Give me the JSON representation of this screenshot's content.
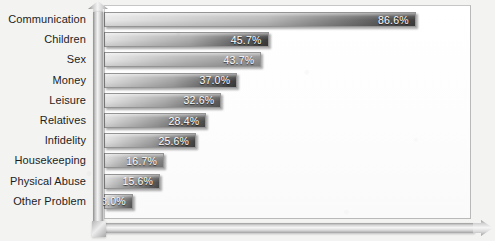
{
  "chart_data": {
    "type": "bar",
    "orientation": "horizontal",
    "title": "",
    "subtitle": "",
    "xlabel": "",
    "ylabel": "",
    "grid": false,
    "legend": null,
    "xlim": [
      0,
      100
    ],
    "value_suffix": "%",
    "categories": [
      "Communication",
      "Children",
      "Sex",
      "Money",
      "Leisure",
      "Relatives",
      "Infidelity",
      "Housekeeping",
      "Physical Abuse",
      "Other Problem"
    ],
    "values": [
      86.6,
      45.7,
      43.7,
      37.0,
      32.6,
      28.4,
      25.6,
      16.7,
      15.6,
      8.0
    ],
    "value_labels": [
      "86.6%",
      "45.7%",
      "43.7%",
      "37.0%",
      "32.6%",
      "28.4%",
      "25.6%",
      "16.7%",
      "15.6%",
      "8.0%"
    ],
    "bar_colors_start": [
      "#e8e8e8",
      "#e2e2e2",
      "#e6e6e6",
      "#dedede",
      "#e4e4e4",
      "#dcdcdc",
      "#e2e2e2",
      "#dadada",
      "#d8d8d8",
      "#d6d6d6"
    ],
    "bar_colors_mid": [
      "#b8b8b8",
      "#a9a9a9",
      "#b4b4b4",
      "#a2a2a2",
      "#aaaaaa",
      "#9a9a9a",
      "#a0a0a0",
      "#9b9b9b",
      "#969696",
      "#919191"
    ],
    "bar_colors_end": [
      "#3e3e3e",
      "#3a3a3a",
      "#8e8e8e",
      "#3c3c3c",
      "#575757",
      "#4a4a4a",
      "#414141",
      "#7d7d7d",
      "#4c4c4c",
      "#5a5a5a"
    ]
  },
  "axes": {
    "vertical_axis_name": "category-axis",
    "horizontal_axis_name": "value-axis",
    "horizontal_axis_arrow": "arrow-right",
    "vertical_axis_arrow": "arrow-up"
  },
  "colors": {
    "page_background": "#f3f3f2",
    "plot_background": "#fdfdfd",
    "plot_border": "#b9b9b9",
    "label_text": "#1d1d1d",
    "value_text": "#fbfbfb"
  }
}
